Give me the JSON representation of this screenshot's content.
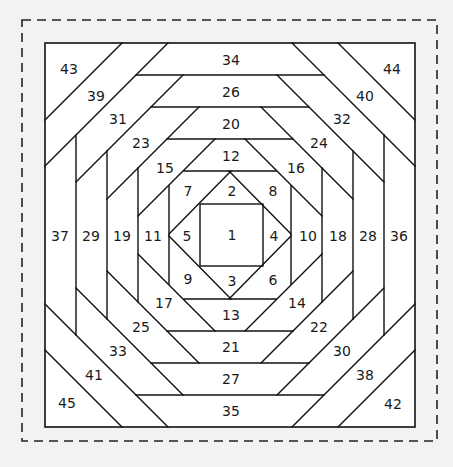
{
  "diagram": {
    "title": "",
    "type": "pineapple quilt block foundation pattern",
    "colors": {
      "background": "#f2f2f2",
      "block_fill": "#ffffff",
      "line": "#111111",
      "dashed_border": "#222222"
    },
    "geometry": {
      "dashed_border": {
        "x1": 22,
        "y1": 20,
        "x2": 437,
        "y2": 441
      },
      "outer_square": {
        "x1": 45,
        "y1": 43,
        "x2": 415,
        "y2": 427
      },
      "center_square": {
        "x1": 200,
        "y1": 204,
        "x2": 263,
        "y2": 266
      },
      "mirror_center": {
        "x": 230,
        "y": 235
      },
      "top_left_diagonals": [
        [
          [
            122,
            43
          ],
          [
            45,
            120
          ]
        ],
        [
          [
            168,
            43
          ],
          [
            45,
            166
          ]
        ],
        [
          [
            183,
            75
          ],
          [
            76,
            182
          ]
        ],
        [
          [
            199,
            107
          ],
          [
            107,
            199
          ]
        ],
        [
          [
            215,
            139
          ],
          [
            138,
            216
          ]
        ],
        [
          [
            231,
            171
          ],
          [
            169,
            234
          ]
        ]
      ],
      "top_horizontals": [
        {
          "y": 75,
          "x_start": 136
        },
        {
          "y": 107,
          "x_start": 151
        },
        {
          "y": 139,
          "x_start": 167
        },
        {
          "y": 171,
          "x_start": 184
        }
      ],
      "left_verticals": [
        {
          "x": 76,
          "y_start": 135
        },
        {
          "x": 107,
          "y_start": 151
        },
        {
          "x": 138,
          "y_start": 168
        },
        {
          "x": 169,
          "y_start": 186
        }
      ]
    },
    "pieces": [
      {
        "n": "1",
        "x": 232,
        "y": 235
      },
      {
        "n": "2",
        "x": 232,
        "y": 191
      },
      {
        "n": "3",
        "x": 232,
        "y": 281
      },
      {
        "n": "4",
        "x": 274,
        "y": 236
      },
      {
        "n": "5",
        "x": 187,
        "y": 236
      },
      {
        "n": "6",
        "x": 273,
        "y": 280
      },
      {
        "n": "7",
        "x": 188,
        "y": 191
      },
      {
        "n": "8",
        "x": 273,
        "y": 191
      },
      {
        "n": "9",
        "x": 188,
        "y": 279
      },
      {
        "n": "10",
        "x": 308,
        "y": 236
      },
      {
        "n": "11",
        "x": 153,
        "y": 236
      },
      {
        "n": "12",
        "x": 231,
        "y": 156
      },
      {
        "n": "13",
        "x": 231,
        "y": 315
      },
      {
        "n": "14",
        "x": 297,
        "y": 303
      },
      {
        "n": "15",
        "x": 165,
        "y": 168
      },
      {
        "n": "16",
        "x": 296,
        "y": 168
      },
      {
        "n": "17",
        "x": 164,
        "y": 303
      },
      {
        "n": "18",
        "x": 338,
        "y": 236
      },
      {
        "n": "19",
        "x": 122,
        "y": 236
      },
      {
        "n": "20",
        "x": 231,
        "y": 124
      },
      {
        "n": "21",
        "x": 231,
        "y": 347
      },
      {
        "n": "22",
        "x": 319,
        "y": 327
      },
      {
        "n": "23",
        "x": 141,
        "y": 143
      },
      {
        "n": "24",
        "x": 319,
        "y": 143
      },
      {
        "n": "25",
        "x": 141,
        "y": 327
      },
      {
        "n": "26",
        "x": 231,
        "y": 92
      },
      {
        "n": "27",
        "x": 231,
        "y": 379
      },
      {
        "n": "28",
        "x": 368,
        "y": 236
      },
      {
        "n": "29",
        "x": 91,
        "y": 236
      },
      {
        "n": "30",
        "x": 342,
        "y": 351
      },
      {
        "n": "31",
        "x": 118,
        "y": 119
      },
      {
        "n": "32",
        "x": 342,
        "y": 119
      },
      {
        "n": "33",
        "x": 118,
        "y": 351
      },
      {
        "n": "34",
        "x": 231,
        "y": 60
      },
      {
        "n": "35",
        "x": 231,
        "y": 411
      },
      {
        "n": "36",
        "x": 399,
        "y": 236
      },
      {
        "n": "37",
        "x": 60,
        "y": 236
      },
      {
        "n": "38",
        "x": 365,
        "y": 375
      },
      {
        "n": "39",
        "x": 96,
        "y": 96
      },
      {
        "n": "40",
        "x": 365,
        "y": 96
      },
      {
        "n": "41",
        "x": 94,
        "y": 375
      },
      {
        "n": "42",
        "x": 393,
        "y": 404
      },
      {
        "n": "43",
        "x": 69,
        "y": 69
      },
      {
        "n": "44",
        "x": 392,
        "y": 69
      },
      {
        "n": "45",
        "x": 67,
        "y": 403
      }
    ]
  }
}
